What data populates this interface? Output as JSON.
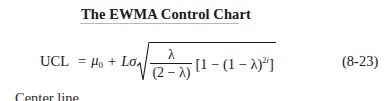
{
  "section": {
    "heading": "The EWMA Control Chart"
  },
  "equation": {
    "lhs": "UCL",
    "equals": "=",
    "mu": "μ",
    "mu_sub": "0",
    "plus": "+",
    "L": "L",
    "sigma": "σ",
    "fraction": {
      "numerator": "λ",
      "denominator": "(2 − λ)"
    },
    "bracket_open": "[1 − (1 − λ)",
    "exponent_num": "2",
    "exponent_var": "i",
    "bracket_close": "]",
    "number": "(8-23)"
  },
  "next_line": {
    "text": "Center line"
  }
}
